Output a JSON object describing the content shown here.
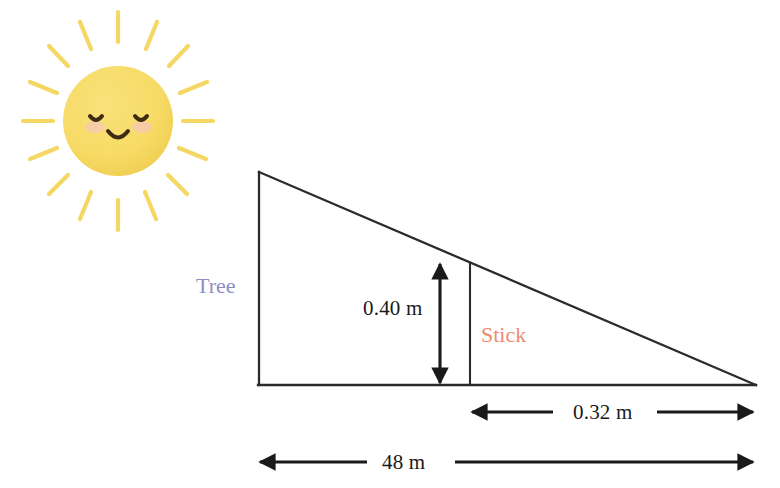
{
  "scene": {
    "title": "Tree and stick shadow similar-triangles diagram",
    "background_color": "#ffffff"
  },
  "sun": {
    "name": "smiling-sun",
    "body_color": "#f7db66",
    "body_shade_color": "#f2cf52",
    "ray_color": "#f5d764",
    "face_color": "#3d2b14",
    "cheek_color": "#f6c6b8",
    "ray_count": 12,
    "expression": "closed-eyes-smile"
  },
  "diagram": {
    "line_color": "#2b2b2b",
    "tree_label": "Tree",
    "tree_label_color": "#8d8ec6",
    "stick_label": "Stick",
    "stick_label_color": "#f08b6e",
    "stick_line_color": "#2b2b2b",
    "vertices": {
      "apex": [
        259,
        172
      ],
      "base_left": [
        259,
        385
      ],
      "base_right": [
        755,
        385
      ]
    },
    "stick_x": 470,
    "stick_top_y": 263,
    "stick_bottom_y": 385
  },
  "measurements": [
    {
      "id": "stick-height",
      "label": "0.40 m",
      "value": 0.4,
      "unit": "m",
      "orientation": "vertical",
      "from": [
        440,
        262
      ],
      "to": [
        440,
        385
      ],
      "describes": "stick height"
    },
    {
      "id": "stick-shadow",
      "label": "0.32 m",
      "value": 0.32,
      "unit": "m",
      "orientation": "horizontal",
      "from": [
        470,
        412
      ],
      "to": [
        755,
        412
      ],
      "describes": "stick shadow length"
    },
    {
      "id": "tree-shadow",
      "label": "48 m",
      "value": 48,
      "unit": "m",
      "orientation": "horizontal",
      "from": [
        258,
        462
      ],
      "to": [
        755,
        462
      ],
      "describes": "tree shadow length"
    }
  ]
}
